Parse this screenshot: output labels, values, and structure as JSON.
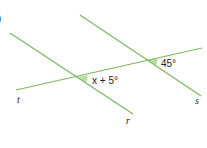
{
  "diagram": {
    "part_marker": ")",
    "line_color": "#7bb661",
    "angle_fill": "#b9dca4",
    "lines": [
      {
        "name": "r",
        "x1": 10,
        "y1": 33,
        "x2": 133,
        "y2": 114
      },
      {
        "name": "s",
        "x1": 80,
        "y1": 15,
        "x2": 201,
        "y2": 96
      },
      {
        "name": "t",
        "x1": 16,
        "y1": 90,
        "x2": 202,
        "y2": 48
      }
    ],
    "labels": {
      "t": "t",
      "r": "r",
      "s": "s"
    },
    "angles": {
      "lower": "x + 5°",
      "upper": "45°"
    }
  }
}
